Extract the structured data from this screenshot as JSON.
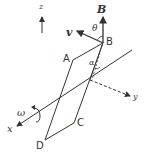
{
  "diagram": {
    "type": "physics-rotating-loop",
    "labels": {
      "z_axis": "z",
      "x_axis": "x",
      "y_axis": "y",
      "field": "B",
      "velocity": "v",
      "theta": "θ",
      "alpha": "α",
      "omega": "ω",
      "corner_a": "A",
      "corner_b": "B",
      "corner_c": "C",
      "corner_d": "D"
    },
    "colors": {
      "line": "#333333",
      "background": "#ffffff"
    }
  }
}
